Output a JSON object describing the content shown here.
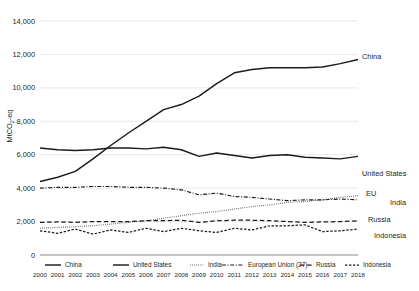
{
  "chart_data": {
    "type": "line",
    "title": "",
    "xlabel": "",
    "ylabel": "MtCO2-eq",
    "ylabel_display": "MtCO₂-eq",
    "ylim": [
      0,
      14000
    ],
    "ytick_values": [
      0,
      2000,
      4000,
      6000,
      8000,
      10000,
      12000,
      14000
    ],
    "ytick_labels": [
      "0",
      "2,000",
      "4,000",
      "6,000",
      "8,000",
      "10,000",
      "12,000",
      "14,000"
    ],
    "grid": true,
    "legend_position": "bottom",
    "x": [
      2000,
      2001,
      2002,
      2003,
      2004,
      2005,
      2006,
      2007,
      2008,
      2009,
      2010,
      2011,
      2012,
      2013,
      2014,
      2015,
      2016,
      2017,
      2018
    ],
    "xtick_labels": [
      "2000",
      "2001",
      "2002",
      "2003",
      "2004",
      "2005",
      "2006",
      "2007",
      "2008",
      "2009",
      "2010",
      "2011",
      "2012",
      "2013",
      "2014",
      "2015",
      "2016",
      "2017",
      "2018"
    ],
    "series": [
      {
        "name": "China",
        "style": "solid",
        "end_label": "China",
        "values": [
          4400,
          4650,
          5000,
          5750,
          6550,
          7300,
          8000,
          8700,
          9000,
          9500,
          10250,
          10900,
          11100,
          11200,
          11200,
          11200,
          11250,
          11450,
          11700
        ]
      },
      {
        "name": "United States",
        "style": "solid",
        "end_label": "United States",
        "values": [
          6400,
          6300,
          6250,
          6300,
          6400,
          6400,
          6350,
          6450,
          6300,
          5900,
          6100,
          5950,
          5800,
          5950,
          6000,
          5850,
          5800,
          5750,
          5900
        ]
      },
      {
        "name": "India",
        "style": "dotted",
        "end_label": "India",
        "values": [
          1600,
          1650,
          1700,
          1750,
          1850,
          1950,
          2050,
          2200,
          2350,
          2500,
          2600,
          2750,
          2900,
          3000,
          3150,
          3200,
          3300,
          3450,
          3550
        ]
      },
      {
        "name": "European Union (27)",
        "style": "dashdot",
        "end_label": "EU",
        "values": [
          4000,
          4050,
          4050,
          4100,
          4100,
          4050,
          4050,
          4000,
          3900,
          3600,
          3700,
          3500,
          3450,
          3350,
          3250,
          3300,
          3300,
          3350,
          3300
        ]
      },
      {
        "name": "Russia",
        "style": "dashed",
        "end_label": "Russia",
        "values": [
          1950,
          1980,
          1950,
          2000,
          2000,
          2000,
          2050,
          2050,
          2080,
          1950,
          2050,
          2080,
          2080,
          2050,
          2000,
          1950,
          1980,
          2000,
          2050
        ]
      },
      {
        "name": "Indonesia",
        "style": "shortdash",
        "end_label": "Indonesia",
        "values": [
          1450,
          1300,
          1550,
          1250,
          1500,
          1350,
          1600,
          1400,
          1600,
          1450,
          1350,
          1600,
          1500,
          1750,
          1750,
          1800,
          1400,
          1450,
          1550
        ]
      }
    ],
    "legend": [
      {
        "label": "China",
        "style": "solid"
      },
      {
        "label": "United States",
        "style": "solid"
      },
      {
        "label": "India",
        "style": "dotted"
      },
      {
        "label": "European Union (27)",
        "style": "dashdot"
      },
      {
        "label": "Russia",
        "style": "dashed"
      },
      {
        "label": "Indonesia",
        "style": "shortdash"
      }
    ]
  }
}
